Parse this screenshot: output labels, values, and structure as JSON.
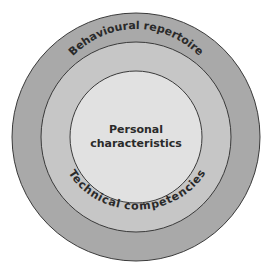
{
  "diagram": {
    "type": "concentric-circles",
    "rings": [
      {
        "name": "outer",
        "label": "Behavioural repertoire",
        "color": "#a9a9a9"
      },
      {
        "name": "middle",
        "label": "Technical competencies",
        "color": "#c6c6c6"
      },
      {
        "name": "inner",
        "label_line1": "Personal",
        "label_line2": "characteristics",
        "color": "#e1e1e1"
      }
    ],
    "stroke_color": "#3a3a3a"
  }
}
